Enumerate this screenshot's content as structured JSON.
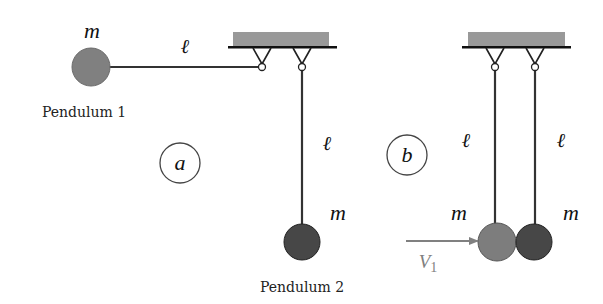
{
  "figure": {
    "panel_a": {
      "label": "a",
      "pendulum_1": {
        "caption": "Pendulum 1",
        "mass_label": "m",
        "length_label": "ℓ",
        "ball_color": "#808080"
      },
      "pendulum_2": {
        "caption": "Pendulum 2",
        "mass_label": "m",
        "length_label": "ℓ",
        "ball_color": "#474747"
      }
    },
    "panel_b": {
      "label": "b",
      "left_ball": {
        "mass_label": "m",
        "length_label": "ℓ",
        "ball_color": "#7d7d7d"
      },
      "right_ball": {
        "mass_label": "m",
        "length_label": "ℓ",
        "ball_color": "#474747"
      },
      "velocity_label": "V",
      "velocity_subscript": "1",
      "arrow_color": "#808080"
    },
    "support_color": "#999999",
    "line_color": "#222222"
  }
}
